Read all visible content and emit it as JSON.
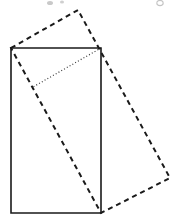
{
  "figure": {
    "name": "rotated-rectangle-geometry-figure",
    "type": "geometry-diagram",
    "width": 178,
    "height": 222,
    "background_color": "#ffffff",
    "stroke_color": "#1a1a1a",
    "artifact_color": "#b5b5b5",
    "shapes": {
      "solid_rectangle": {
        "label": "solid-rectangle",
        "style": "solid",
        "stroke_width": 1.6,
        "points": [
          [
            11,
            48
          ],
          [
            101,
            48
          ],
          [
            101,
            213
          ],
          [
            11,
            213
          ]
        ],
        "corners": {
          "top_left": [
            11,
            48
          ],
          "top_right": [
            101,
            48
          ],
          "bottom_right": [
            101,
            213
          ],
          "bottom_left": [
            11,
            213
          ]
        },
        "width": 90,
        "height": 165
      },
      "dashed_rectangle": {
        "label": "dashed-rotated-rectangle",
        "style": "dashed",
        "stroke_width": 2.0,
        "dash_pattern": "5,4",
        "points": [
          [
            11,
            48
          ],
          [
            78,
            10
          ],
          [
            170,
            178
          ],
          [
            101,
            213
          ]
        ],
        "corners": {
          "left": [
            11,
            48
          ],
          "top": [
            78,
            10
          ],
          "right": [
            170,
            178
          ],
          "bottom": [
            101,
            213
          ]
        },
        "note": "Shares the bottom vertex with the solid rectangle's bottom-right corner and the left vertex with the solid rectangle's top-left corner."
      },
      "dotted_segment": {
        "label": "dotted-perpendicular-segment",
        "style": "dotted",
        "stroke_width": 1.2,
        "dash_pattern": "1,2.2",
        "from": [
          101,
          48
        ],
        "to": [
          33,
          87
        ],
        "note": "Runs from the solid rectangle's top-right corner to a point on the dashed rectangle's left edge."
      }
    },
    "artifacts": [
      {
        "label": "scan-speck-left",
        "cx": 50,
        "cy": 3,
        "rx": 3.0,
        "ry": 2.0
      },
      {
        "label": "scan-speck-center",
        "cx": 62,
        "cy": 2,
        "rx": 2.0,
        "ry": 1.6
      },
      {
        "label": "scan-speck-right",
        "cx": 160,
        "cy": 3,
        "rx": 3.2,
        "ry": 2.6
      }
    ]
  }
}
